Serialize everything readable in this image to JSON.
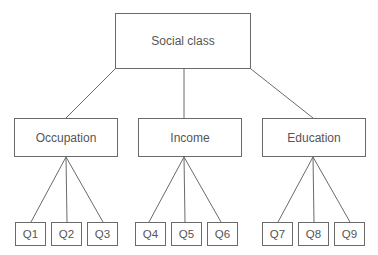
{
  "diagram": {
    "root": {
      "label": "Social class"
    },
    "categories": [
      {
        "label": "Occupation",
        "items": [
          "Q1",
          "Q2",
          "Q3"
        ]
      },
      {
        "label": "Income",
        "items": [
          "Q4",
          "Q5",
          "Q6"
        ]
      },
      {
        "label": "Education",
        "items": [
          "Q7",
          "Q8",
          "Q9"
        ]
      }
    ],
    "colors": {
      "line": "#6a6a6a",
      "text": "#555555",
      "background": "#ffffff"
    }
  }
}
